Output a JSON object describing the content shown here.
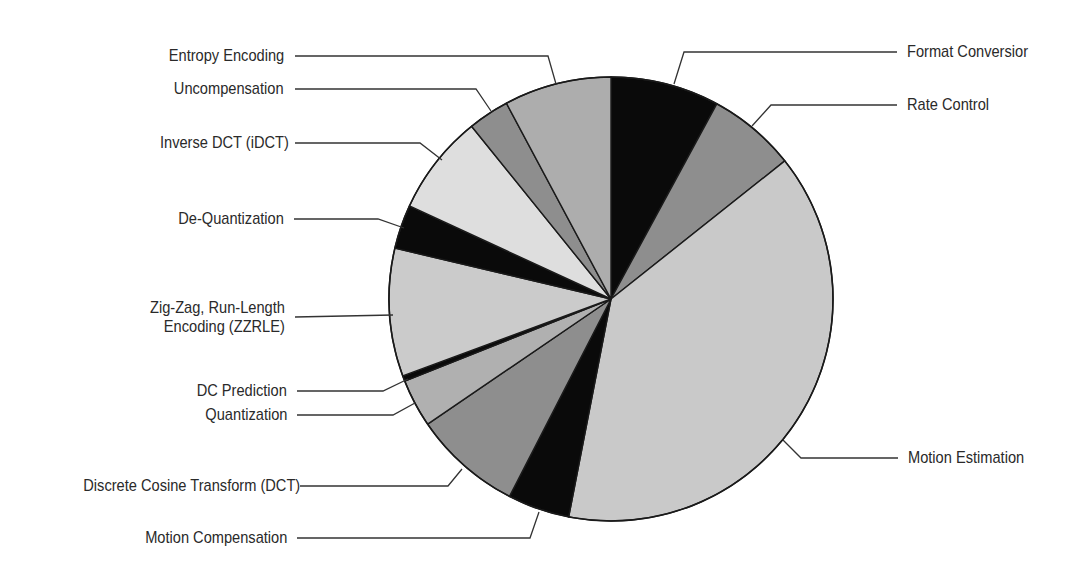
{
  "chart_data": {
    "type": "pie",
    "title": "",
    "start_angle_deg": 0,
    "direction": "clockwise",
    "unit": "percent (estimated from slice angles)",
    "slices": [
      {
        "label": "Format Conversion",
        "display_label": "Format Conversior",
        "value": 7.9,
        "color": "#0a0a0a"
      },
      {
        "label": "Rate Control",
        "display_label": "Rate Control",
        "value": 6.4,
        "color": "#8e8e8e"
      },
      {
        "label": "Motion Estimation",
        "display_label": "Motion Estimation",
        "value": 38.7,
        "color": "#c9c9c9"
      },
      {
        "label": "Motion Compensation",
        "display_label": "Motion Compensation",
        "value": 4.5,
        "color": "#0a0a0a"
      },
      {
        "label": "Discrete Cosine Transform (DCT)",
        "display_label": "Discrete Cosine Transform (DCT)",
        "value": 7.9,
        "color": "#8e8e8e"
      },
      {
        "label": "Quantization",
        "display_label": "Quantization",
        "value": 3.5,
        "color": "#b0b0b0"
      },
      {
        "label": "DC Prediction",
        "display_label": "DC Prediction",
        "value": 0.4,
        "color": "#0a0a0a"
      },
      {
        "label": "Zig-Zag, Run-Length Encoding (ZZRLE)",
        "display_label": [
          "Zig-Zag, Run-Length",
          "Encoding (ZZRLE)"
        ],
        "value": 9.3,
        "color": "#cbcbcb"
      },
      {
        "label": "De-Quantization",
        "display_label": "De-Quantization",
        "value": 3.2,
        "color": "#0a0a0a"
      },
      {
        "label": "Inverse DCT (iDCT)",
        "display_label": "Inverse DCT (iDCT)",
        "value": 7.3,
        "color": "#dedede"
      },
      {
        "label": "Uncompensation",
        "display_label": "Uncompensation",
        "value": 3.0,
        "color": "#8e8e8e"
      },
      {
        "label": "Entropy Encoding",
        "display_label": "Entropy Encoding",
        "value": 7.8,
        "color": "#adadad"
      }
    ],
    "legend": "none (leader-line callouts)",
    "grid": false
  },
  "geometry": {
    "cx": 611,
    "cy": 299,
    "r": 222,
    "callouts": [
      {
        "slice": 0,
        "side": "right",
        "points": [
          [
            674,
            84
          ],
          [
            684,
            52
          ],
          [
            897,
            52
          ]
        ],
        "text_x": 907,
        "text_y": 52
      },
      {
        "slice": 1,
        "side": "right",
        "points": [
          [
            752,
            126
          ],
          [
            771,
            105
          ],
          [
            897,
            105
          ]
        ],
        "text_x": 907,
        "text_y": 105
      },
      {
        "slice": 2,
        "side": "right",
        "points": [
          [
            783,
            440
          ],
          [
            801,
            458
          ],
          [
            898,
            458
          ]
        ],
        "text_x": 908,
        "text_y": 458
      },
      {
        "slice": 3,
        "side": "left",
        "points": [
          [
            539,
            512
          ],
          [
            530,
            538
          ],
          [
            297,
            538
          ]
        ],
        "text_x": 287,
        "text_y": 538
      },
      {
        "slice": 4,
        "side": "left",
        "points": [
          [
            462,
            469
          ],
          [
            448,
            486
          ],
          [
            300,
            486
          ]
        ],
        "text_x": 300,
        "text_y": 486
      },
      {
        "slice": 5,
        "side": "left",
        "points": [
          [
            415,
            403
          ],
          [
            393,
            415
          ],
          [
            297,
            415
          ]
        ],
        "text_x": 287,
        "text_y": 415
      },
      {
        "slice": 6,
        "side": "left",
        "points": [
          [
            408,
            379
          ],
          [
            383,
            391
          ],
          [
            297,
            391
          ]
        ],
        "text_x": 287,
        "text_y": 391
      },
      {
        "slice": 7,
        "side": "left",
        "points": [
          [
            393,
            315
          ],
          [
            295,
            317
          ]
        ],
        "text_x": 285,
        "text_y": 317
      },
      {
        "slice": 8,
        "side": "left",
        "points": [
          [
            404,
            228
          ],
          [
            378,
            219
          ],
          [
            294,
            219
          ]
        ],
        "text_x": 284,
        "text_y": 219
      },
      {
        "slice": 9,
        "side": "left",
        "points": [
          [
            442,
            160
          ],
          [
            420,
            143
          ],
          [
            295,
            143
          ]
        ],
        "text_x": 289,
        "text_y": 143
      },
      {
        "slice": 10,
        "side": "left",
        "points": [
          [
            491,
            111
          ],
          [
            476,
            89
          ],
          [
            295,
            89
          ]
        ],
        "text_x": 284,
        "text_y": 89
      },
      {
        "slice": 11,
        "side": "left",
        "points": [
          [
            556,
            84
          ],
          [
            548,
            56
          ],
          [
            295,
            56
          ]
        ],
        "text_x": 284,
        "text_y": 56
      }
    ]
  }
}
